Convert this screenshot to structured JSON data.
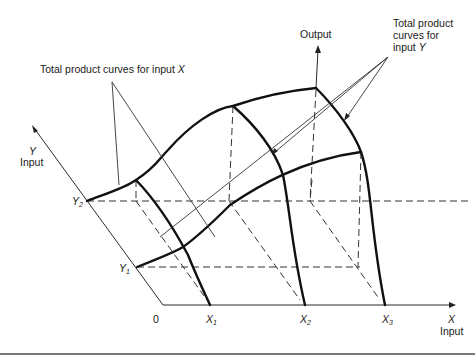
{
  "figure": {
    "labels": {
      "output": "Output",
      "tp_x": "Total product curves for input ",
      "tp_x_var": "X",
      "tp_y_line1": "Total product",
      "tp_y_line2": "curves for",
      "tp_y_line3": "input ",
      "tp_y_var": "Y",
      "y_axis_var": "Y",
      "y_axis_name": "Input",
      "x_axis_var": "X",
      "x_axis_name": "Input",
      "origin": "0"
    },
    "x_ticks": [
      {
        "var": "X",
        "sub": "1"
      },
      {
        "var": "X",
        "sub": "2"
      },
      {
        "var": "X",
        "sub": "3"
      }
    ],
    "y_ticks": [
      {
        "var": "Y",
        "sub": "1"
      },
      {
        "var": "Y",
        "sub": "2"
      }
    ],
    "colors": {
      "line": "#111111",
      "background": "#ffffff"
    }
  }
}
